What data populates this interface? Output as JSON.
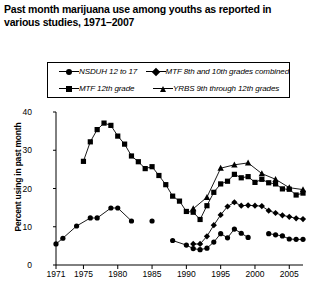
{
  "title": "Past month marijuana use among youths as reported in various studies, 1971–2007",
  "legend": {
    "position": "top",
    "items": [
      {
        "label": "NSDUH 12 to 17",
        "marker": "circle-marker",
        "color": "#000000"
      },
      {
        "label": "MTF 8th and 10th grades combined",
        "marker": "diamond-marker",
        "color": "#000000"
      },
      {
        "label": "MTF 12th grade",
        "marker": "square-marker",
        "color": "#000000"
      },
      {
        "label": "YRBS 9th through 12th grades",
        "marker": "triangle-marker",
        "color": "#000000"
      }
    ]
  },
  "axes": {
    "ylabel": "Percent using in past month",
    "yticks": [
      "40",
      "30",
      "20",
      "10",
      "0"
    ],
    "xticks": [
      "1971",
      "1975",
      "1980",
      "1985",
      "1990",
      "1995",
      "2000",
      "2005"
    ]
  },
  "chart_data": {
    "type": "line",
    "title": "Past month marijuana use among youths as reported in various studies, 1971–2007",
    "xlabel": "",
    "ylabel": "Percent using in past month",
    "xlim": [
      1971,
      2007
    ],
    "ylim": [
      0,
      40
    ],
    "yticks": [
      0,
      10,
      20,
      30,
      40
    ],
    "xticks": [
      1971,
      1975,
      1980,
      1985,
      1990,
      1995,
      2000,
      2005
    ],
    "grid": false,
    "legend_position": "top",
    "series": [
      {
        "name": "NSDUH 12 to 17",
        "marker": "circle",
        "color": "#000000",
        "points": [
          [
            1971,
            5.5
          ],
          [
            1972,
            7.0
          ],
          [
            1974,
            10.2
          ],
          [
            1976,
            12.3
          ],
          [
            1977,
            12.3
          ],
          [
            1979,
            14.9
          ],
          [
            1980,
            14.9
          ],
          [
            1982,
            11.5
          ],
          [
            1985,
            11.5
          ],
          [
            1988,
            6.4
          ],
          [
            1990,
            5.2
          ],
          [
            1991,
            4.3
          ],
          [
            1992,
            4.0
          ],
          [
            1993,
            4.4
          ],
          [
            1994,
            6.0
          ],
          [
            1995,
            8.2
          ],
          [
            1996,
            7.1
          ],
          [
            1997,
            9.4
          ],
          [
            1998,
            8.3
          ],
          [
            1999,
            7.2
          ],
          [
            2002,
            8.2
          ],
          [
            2003,
            7.9
          ],
          [
            2004,
            7.6
          ],
          [
            2005,
            6.8
          ],
          [
            2006,
            6.7
          ],
          [
            2007,
            6.7
          ]
        ]
      },
      {
        "name": "MTF 12th grade",
        "marker": "square",
        "color": "#000000",
        "points": [
          [
            1975,
            27.1
          ],
          [
            1976,
            32.2
          ],
          [
            1977,
            35.4
          ],
          [
            1978,
            37.1
          ],
          [
            1979,
            36.5
          ],
          [
            1980,
            33.7
          ],
          [
            1981,
            31.6
          ],
          [
            1982,
            28.5
          ],
          [
            1983,
            27.0
          ],
          [
            1984,
            25.2
          ],
          [
            1985,
            25.7
          ],
          [
            1986,
            23.4
          ],
          [
            1987,
            21.0
          ],
          [
            1988,
            18.0
          ],
          [
            1989,
            16.7
          ],
          [
            1990,
            14.0
          ],
          [
            1991,
            13.8
          ],
          [
            1992,
            11.9
          ],
          [
            1993,
            15.5
          ],
          [
            1994,
            19.0
          ],
          [
            1995,
            21.2
          ],
          [
            1996,
            21.9
          ],
          [
            1997,
            23.7
          ],
          [
            1998,
            22.8
          ],
          [
            1999,
            23.1
          ],
          [
            2000,
            21.6
          ],
          [
            2001,
            22.4
          ],
          [
            2002,
            21.5
          ],
          [
            2003,
            21.2
          ],
          [
            2004,
            19.9
          ],
          [
            2005,
            19.8
          ],
          [
            2006,
            18.3
          ],
          [
            2007,
            18.8
          ]
        ]
      },
      {
        "name": "MTF 8th and 10th grades combined",
        "marker": "diamond",
        "color": "#000000",
        "points": [
          [
            1991,
            5.5
          ],
          [
            1992,
            5.5
          ],
          [
            1993,
            7.5
          ],
          [
            1994,
            10.4
          ],
          [
            1995,
            13.1
          ],
          [
            1996,
            15.3
          ],
          [
            1997,
            16.4
          ],
          [
            1998,
            15.5
          ],
          [
            1999,
            15.6
          ],
          [
            2000,
            15.5
          ],
          [
            2001,
            15.4
          ],
          [
            2002,
            14.2
          ],
          [
            2003,
            13.6
          ],
          [
            2004,
            13.0
          ],
          [
            2005,
            12.6
          ],
          [
            2006,
            12.2
          ],
          [
            2007,
            12.0
          ]
        ]
      },
      {
        "name": "YRBS 9th through 12th grades",
        "marker": "triangle",
        "color": "#000000",
        "points": [
          [
            1991,
            14.7
          ],
          [
            1993,
            17.7
          ],
          [
            1995,
            25.3
          ],
          [
            1997,
            26.2
          ],
          [
            1999,
            26.7
          ],
          [
            2001,
            23.9
          ],
          [
            2003,
            22.4
          ],
          [
            2005,
            20.2
          ],
          [
            2007,
            19.7
          ]
        ]
      }
    ]
  }
}
